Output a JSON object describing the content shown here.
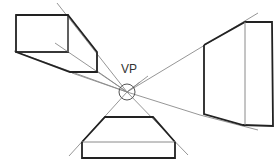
{
  "diagram": {
    "title": "",
    "vanishing_point": {
      "label": "VP",
      "cx": 127,
      "cy": 92,
      "r": 8
    },
    "colors": {
      "thick_line": "#222222",
      "thin_line": "#8a8a8a",
      "background": "#ffffff"
    },
    "shapes": [
      {
        "name": "left-box",
        "description": "Box above-left of vanishing point, receding toward VP"
      },
      {
        "name": "right-box",
        "description": "Box right of vanishing point, receding toward VP"
      },
      {
        "name": "bottom-box",
        "description": "Box below vanishing point, receding toward VP"
      }
    ]
  }
}
